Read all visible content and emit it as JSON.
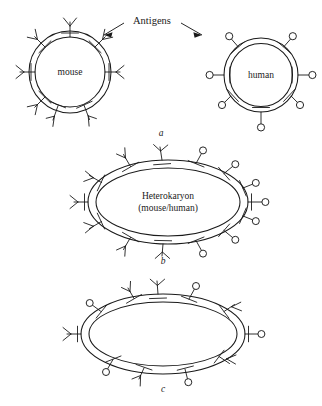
{
  "figure": {
    "background_color": "#ffffff",
    "ink_color": "#1a1a1a",
    "width": 322,
    "height": 406
  },
  "annotation": {
    "antigens_label": "Antigens",
    "arrow_left_name": "arrow-to-mouse-cell",
    "arrow_right_name": "arrow-to-human-cell"
  },
  "panels": [
    {
      "id": "a",
      "label": "a",
      "caption": "Separate mouse and human cells before fusion",
      "cells": [
        {
          "id": "mouse",
          "label": "mouse",
          "shape": "circle",
          "antigen_type": "y-fork",
          "antigen_count": 8
        },
        {
          "id": "human",
          "label": "human",
          "shape": "circle",
          "antigen_type": "circle-knob",
          "antigen_count": 7
        }
      ]
    },
    {
      "id": "b",
      "label": "b",
      "caption": "Freshly fused heterokaryon, antigens still segregated",
      "cells": [
        {
          "id": "heterokaryon-fresh",
          "label_line1": "Heterokaryon",
          "label_line2": "(mouse/human)",
          "shape": "ellipse",
          "left_antigen_type": "y-fork",
          "left_antigen_count": 7,
          "right_antigen_type": "circle-knob",
          "right_antigen_count": 7
        }
      ]
    },
    {
      "id": "c",
      "label": "c",
      "caption": "Heterokaryon after antigens have intermixed",
      "cells": [
        {
          "id": "heterokaryon-mixed",
          "label_line1": "",
          "label_line2": "",
          "shape": "ellipse",
          "antigen_type": "mixed",
          "y_fork_count": 7,
          "circle_knob_count": 7
        }
      ]
    }
  ],
  "legend_semantics": {
    "y_fork": "mouse surface antigen",
    "circle_knob": "human surface antigen"
  }
}
